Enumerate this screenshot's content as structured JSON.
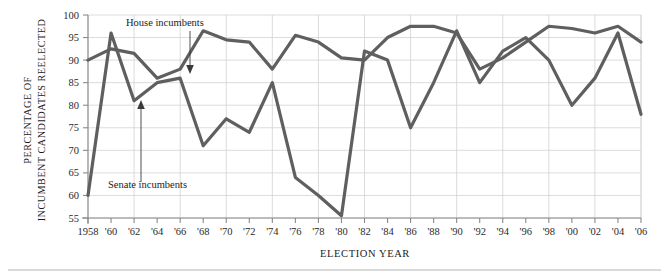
{
  "figure": {
    "name": "incumbent-reelection-line-chart",
    "background": "#ffffff",
    "line_color": "#5f5f5f",
    "grid_color": "#d3d3d3",
    "axis_color": "#8a8a8a"
  },
  "axes": {
    "y_title_line1": "PERCENTAGE OF",
    "y_title_line2": "INCUMBENT CANDIDATES REELECTED",
    "x_title": "ELECTION YEAR",
    "y_ticks": [
      "100",
      "95",
      "90",
      "85",
      "80",
      "75",
      "70",
      "65",
      "60",
      "55"
    ],
    "x_ticks": [
      "1958",
      "'60",
      "'62",
      "'64",
      "'66",
      "'68",
      "'70",
      "'72",
      "'74",
      "'76",
      "'78",
      "'80",
      "'82",
      "'84",
      "'86",
      "'88",
      "'90",
      "'92",
      "'94",
      "'96",
      "'98",
      "'00",
      "'02",
      "'04",
      "'06"
    ]
  },
  "annotations": [
    {
      "name": "house-incumbents-annotation",
      "label": "House incumbents"
    },
    {
      "name": "senate-incumbents-annotation",
      "label": "Senate incumbents"
    }
  ],
  "chart_data": {
    "type": "line",
    "title": "",
    "xlabel": "ELECTION YEAR",
    "ylabel": "PERCENTAGE OF INCUMBENT CANDIDATES REELECTED",
    "xlim": [
      1958,
      2006
    ],
    "ylim": [
      55,
      100
    ],
    "ytick_values": [
      100,
      95,
      90,
      85,
      80,
      75,
      70,
      65,
      60,
      55
    ],
    "grid": true,
    "legend": "inline-annotations",
    "x": [
      1958,
      1960,
      1962,
      1964,
      1966,
      1968,
      1970,
      1972,
      1974,
      1976,
      1978,
      1980,
      1982,
      1984,
      1986,
      1988,
      1990,
      1992,
      1994,
      1996,
      1998,
      2000,
      2002,
      2004,
      2006
    ],
    "categories": [
      "1958",
      "'60",
      "'62",
      "'64",
      "'66",
      "'68",
      "'70",
      "'72",
      "'74",
      "'76",
      "'78",
      "'80",
      "'82",
      "'84",
      "'86",
      "'88",
      "'90",
      "'92",
      "'94",
      "'96",
      "'98",
      "'00",
      "'02",
      "'04",
      "'06"
    ],
    "series": [
      {
        "name": "House incumbents",
        "values": [
          90,
          92.5,
          91.5,
          86,
          88,
          96.5,
          94.5,
          94,
          88,
          95.5,
          94,
          90.5,
          90,
          95,
          97.5,
          97.5,
          96,
          88,
          90.5,
          94,
          97.5,
          97,
          96,
          97.5,
          94
        ]
      },
      {
        "name": "Senate incumbents",
        "values": [
          60,
          96,
          81,
          85,
          86,
          71,
          77,
          74,
          85,
          64,
          60,
          55.5,
          92,
          90,
          75,
          85,
          96.5,
          85,
          92,
          95,
          90,
          80,
          86,
          96,
          78
        ]
      }
    ]
  }
}
